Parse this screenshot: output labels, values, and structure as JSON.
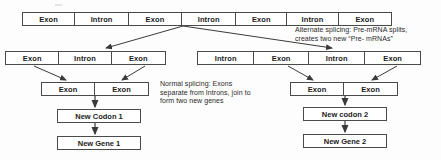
{
  "diagram": {
    "line_color": "#4a4a4a",
    "text_color": "#1a1a1a",
    "background": "#ffffff",
    "pre_mrna_row": {
      "name": "original-pre-mrna",
      "segments": [
        {
          "label": "Exon"
        },
        {
          "label": "Intron"
        },
        {
          "label": "Exon"
        },
        {
          "label": "Intron"
        },
        {
          "label": "Exon"
        },
        {
          "label": "Intron"
        },
        {
          "label": "Exon"
        }
      ]
    },
    "left_mrna_row": {
      "name": "left-pre-mrna",
      "segments": [
        {
          "label": "Exon"
        },
        {
          "label": "Intron"
        },
        {
          "label": "Exon"
        }
      ]
    },
    "right_mrna_row": {
      "name": "right-pre-mrna",
      "segments": [
        {
          "label": "Intron"
        },
        {
          "label": "Exon"
        },
        {
          "label": "Intron"
        },
        {
          "label": "Exon"
        }
      ]
    },
    "left_exon_pair": {
      "name": "left-joined-exons",
      "segments": [
        {
          "label": "Exon"
        },
        {
          "label": "Exon"
        }
      ]
    },
    "right_exon_pair": {
      "name": "right-joined-exons",
      "segments": [
        {
          "label": "Exon"
        },
        {
          "label": "Exon"
        }
      ]
    },
    "left_codon_box": "New Codon 1",
    "left_gene_box": "New Gene 1",
    "right_codon_box": "New codon 2",
    "right_gene_box": "New Gene 2",
    "alternate_splicing_note": "Alternate splicing: Pre-mRNA splits,\ncreates two new “Pre- mRNAs”",
    "normal_splicing_note": "Normal splicing: Exons\nseparate from Introns, join to\nform two new genes"
  }
}
